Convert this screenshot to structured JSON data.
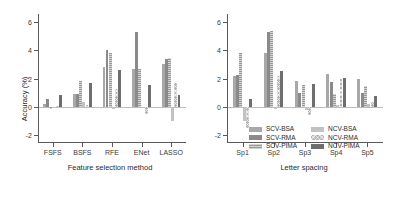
{
  "chart_data": [
    {
      "type": "bar",
      "panel": "left",
      "title": "",
      "xlabel": "Feature selection method",
      "ylabel": "Accuracy (%)",
      "categories": [
        "FSFS",
        "BSFS",
        "RFE",
        "ENet",
        "LASSO"
      ],
      "ylim": [
        -2.6,
        6.6
      ],
      "yticks": [
        -2,
        0,
        2,
        4,
        6
      ],
      "ytick_labels": [
        "-2",
        "0",
        "2",
        "4",
        "6"
      ],
      "grid": false,
      "legend": "none",
      "series": [
        {
          "name": "SCV-BSA",
          "values": [
            0.2,
            0.9,
            2.8,
            2.7,
            3.05
          ]
        },
        {
          "name": "SCV-RMA",
          "values": [
            0.55,
            0.9,
            4.05,
            5.35,
            3.4
          ]
        },
        {
          "name": "SCV-PIMA",
          "values": [
            -0.15,
            1.8,
            3.85,
            2.7,
            3.45
          ]
        },
        {
          "name": "NCV-BSA",
          "values": [
            -0.1,
            0.3,
            -0.2,
            -0.1,
            -1.05
          ]
        },
        {
          "name": "NCV-RMA",
          "values": [
            0.05,
            0.1,
            1.25,
            -0.55,
            1.7
          ]
        },
        {
          "name": "NCV-PIMA",
          "values": [
            0.85,
            1.65,
            2.6,
            1.55,
            0.85
          ]
        }
      ]
    },
    {
      "type": "bar",
      "panel": "right",
      "title": "",
      "xlabel": "Letter spacing",
      "ylabel": "Accuracy (%)",
      "categories": [
        "Sp1",
        "Sp2",
        "Sp3",
        "Sp4",
        "Sp5"
      ],
      "ylim": [
        -2.6,
        6.6
      ],
      "yticks": [
        -2,
        0,
        2,
        4,
        6
      ],
      "ytick_labels": [
        "-2",
        "0",
        "2",
        "4",
        "6"
      ],
      "grid": false,
      "legend": "inside-bottom-center",
      "series": [
        {
          "name": "SCV-BSA",
          "values": [
            2.15,
            3.8,
            1.85,
            2.3,
            1.95
          ]
        },
        {
          "name": "SCV-RMA",
          "values": [
            2.25,
            5.35,
            1.0,
            1.75,
            1.0
          ]
        },
        {
          "name": "SCV-PIMA",
          "values": [
            3.8,
            5.4,
            1.55,
            0.9,
            1.45
          ]
        },
        {
          "name": "NCV-BSA",
          "values": [
            -1.05,
            -0.2,
            -0.25,
            0.1,
            0.2
          ]
        },
        {
          "name": "NCV-RMA",
          "values": [
            -1.55,
            2.15,
            -0.6,
            2.0,
            0.3
          ]
        },
        {
          "name": "NCV-PIMA",
          "values": [
            0.55,
            2.5,
            1.6,
            2.05,
            0.75
          ]
        }
      ]
    }
  ],
  "legend": {
    "entries": [
      {
        "label": "SCV-BSA",
        "series_index": 0,
        "color": "#a8a8a8"
      },
      {
        "label": "NCV-BSA",
        "series_index": 3,
        "color": "#c2c2c2"
      },
      {
        "label": "SCV-RMA",
        "series_index": 1,
        "color": "#8a8a8a"
      },
      {
        "label": "NCV-RMA",
        "series_index": 4,
        "color": "#b5b5b5"
      },
      {
        "label": "SCV-PIMA",
        "series_index": 2,
        "color": "#9b9b9b"
      },
      {
        "label": "NCV-PIMA",
        "series_index": 5,
        "color": "#6e6e6e"
      }
    ]
  }
}
